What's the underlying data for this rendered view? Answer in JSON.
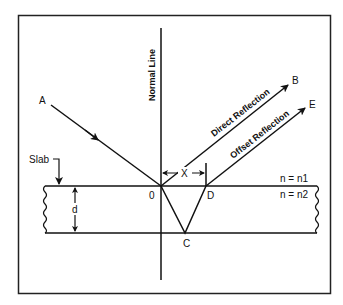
{
  "diagram": {
    "labels": {
      "normal_line": "Normal Line",
      "point_a": "A",
      "point_b": "B",
      "point_c": "C",
      "point_d": "D",
      "point_e": "E",
      "point_o": "0",
      "direct_reflection": "Direct Reflection",
      "offset_reflection": "Offset Reflection",
      "slab": "Slab",
      "thickness": "d",
      "offset": "X",
      "medium_top": "n = n1",
      "medium_slab": "n = n2"
    }
  }
}
